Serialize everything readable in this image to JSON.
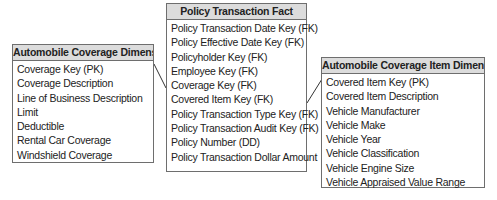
{
  "diagram": {
    "type": "star-schema",
    "tables": {
      "left": {
        "title": "Automobile Coverage Dimension",
        "rows": [
          "Coverage Key (PK)",
          "Coverage Description",
          "Line of Business Description",
          "Limit",
          "Deductible",
          "Rental Car Coverage",
          "Windshield Coverage"
        ]
      },
      "center": {
        "title": "Policy Transaction Fact",
        "rows": [
          "Policy Transaction Date Key (FK)",
          "Policy Effective Date Key (FK)",
          "Policyholder Key (FK)",
          "Employee Key (FK)",
          "Coverage Key (FK)",
          "Covered Item Key (FK)",
          "Policy Transaction Type Key (FK)",
          "Policy Transaction Audit Key (FK)",
          "Policy Number (DD)",
          "Policy Transaction Dollar Amount"
        ]
      },
      "right": {
        "title": "Automobile Coverage Item Dimension",
        "rows": [
          "Covered Item Key (PK)",
          "Covered Item Description",
          "Vehicle Manufacturer",
          "Vehicle Make",
          "Vehicle Year",
          "Vehicle Classification",
          "Vehicle Engine Size",
          "Vehicle Appraised Value Range"
        ]
      }
    },
    "relationships": [
      {
        "from": "Automobile Coverage Dimension.Coverage Key (PK)",
        "to": "Policy Transaction Fact.Coverage Key (FK)"
      },
      {
        "from": "Automobile Coverage Item Dimension.Covered Item Key (PK)",
        "to": "Policy Transaction Fact.Covered Item Key (FK)"
      }
    ],
    "colors": {
      "header_bg": "#dcdcdc",
      "border": "#6e6e6e",
      "line": "#333333"
    }
  }
}
